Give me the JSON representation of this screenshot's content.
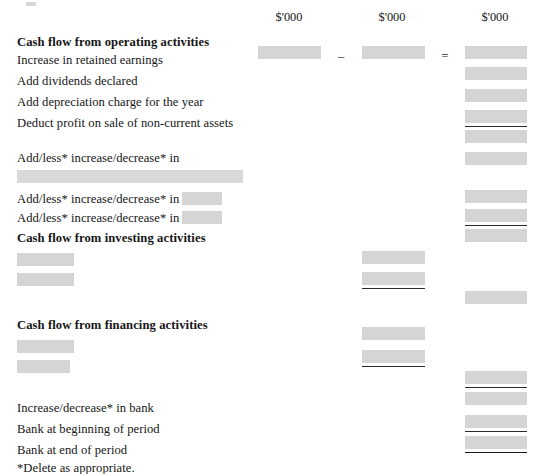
{
  "document": {
    "type": "cash-flow-statement-worksheet",
    "footnote": "*Delete as appropriate."
  },
  "column_headers": [
    {
      "label": "$'000",
      "column": 1
    },
    {
      "label": "$'000",
      "column": 2
    },
    {
      "label": "$'000",
      "column": 3
    }
  ],
  "operators": {
    "minus": "–",
    "equals": "="
  },
  "sections": {
    "operating": {
      "heading": "Cash flow from operating activities",
      "rows": [
        "Increase in retained earnings",
        "Add dividends declared",
        "Add depreciation charge for the year",
        "Deduct profit on sale of non-current assets"
      ],
      "adjustment_rows": [
        "Add/less* increase/decrease* in",
        "Add/less* increase/decrease* in",
        "Add/less* increase/decrease* in"
      ]
    },
    "investing": {
      "heading": "Cash flow from investing activities"
    },
    "financing": {
      "heading": "Cash flow from financing activities"
    },
    "summary": {
      "rows": [
        "Increase/decrease* in bank",
        "Bank at beginning of period",
        "Bank at end of period"
      ]
    }
  },
  "colors": {
    "blank_fill": "#cfcfcf",
    "rule": "#2a2a2a",
    "text": "#161616",
    "page": "#ffffff"
  }
}
